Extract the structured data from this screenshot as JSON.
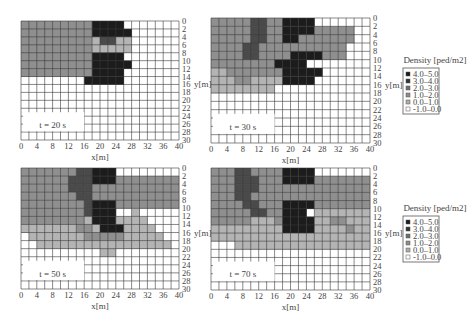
{
  "chart_data": [
    {
      "type": "heatmap",
      "title": "t = 20 s",
      "xlabel": "x[m]",
      "ylabel": "y[m]",
      "xlim": [
        0,
        40
      ],
      "ylim": [
        0,
        30
      ],
      "y_inverted": true,
      "x_ticks": [
        "0",
        "4",
        "8",
        "12",
        "16",
        "20",
        "24",
        "28",
        "32",
        "36",
        "40"
      ],
      "y_ticks": [
        "0",
        "2",
        "4",
        "6",
        "8",
        "10",
        "12",
        "14",
        "16",
        "18",
        "20",
        "22",
        "24",
        "26",
        "28",
        "30"
      ],
      "cell_size_m": 2,
      "grid": true,
      "legend": false,
      "rows": [
        "2222222224444......",
        "22222222244444......",
        "22222222213311......",
        "22222222211111......",
        "2222222224444.......",
        "22222222244444......",
        "2222222224444.......",
        "........44444.......",
        "....................",
        "....................",
        "....................",
        "....................",
        "....................",
        "....................",
        "...................."
      ]
    },
    {
      "type": "heatmap",
      "title": "t = 30 s",
      "xlabel": "x[m]",
      "ylabel": "y[m]",
      "xlim": [
        0,
        40
      ],
      "ylim": [
        0,
        30
      ],
      "y_inverted": true,
      "x_ticks": [
        "0",
        "4",
        "8",
        "12",
        "16",
        "20",
        "24",
        "28",
        "32",
        "36",
        "40"
      ],
      "y_ticks": [
        "0",
        "2",
        "4",
        "6",
        "8",
        "10",
        "12",
        "14",
        "16",
        "18",
        "20",
        "22",
        "24",
        "26",
        "28",
        "30"
      ],
      "cell_size_m": 2,
      "grid": true,
      "legend": true,
      "rows": [
        "2222233224444.......",
        "222223322444422222..",
        "222223322442222222..",
        "22223322222222222...",
        "22223322224444222...",
        "222222224444........",
        "11222222244444......",
        "1112211114444.......",
        "11111111............",
        "....................",
        "....................",
        "....................",
        "....................",
        "....................",
        "...................."
      ]
    },
    {
      "type": "heatmap",
      "title": "t = 50 s",
      "xlabel": "x[m]",
      "ylabel": "y[m]",
      "xlim": [
        0,
        40
      ],
      "ylim": [
        0,
        30
      ],
      "y_inverted": true,
      "x_ticks": [
        "0",
        "4",
        "8",
        "12",
        "16",
        "20",
        "24",
        "28",
        "32",
        "36",
        "40"
      ],
      "y_ticks": [
        "0",
        "2",
        "4",
        "6",
        "8",
        "10",
        "12",
        "14",
        "16",
        "18",
        "20",
        "22",
        "24",
        "26",
        "28",
        "30"
      ],
      "cell_size_m": 2,
      "grid": true,
      "legend": false,
      "rows": [
        "222222233444........",
        "22222233344422222222",
        "22222233322222222222",
        "22222223322222222222",
        "22222222344422222222",
        "222222223444..1.....",
        "2222222214441111....",
        "11111112214441111....",
        ".11111112222211111...",
        "..11111111111111111..",
        "..........11........",
        "....................",
        "....................",
        "....................",
        "...................."
      ]
    },
    {
      "type": "heatmap",
      "title": "t = 70 s",
      "xlabel": "x[m]",
      "ylabel": "y[m]",
      "xlim": [
        0,
        40
      ],
      "ylim": [
        0,
        30
      ],
      "y_inverted": true,
      "x_ticks": [
        "0",
        "4",
        "8",
        "12",
        "16",
        "20",
        "24",
        "28",
        "32",
        "36",
        "40"
      ],
      "y_ticks": [
        "0",
        "2",
        "4",
        "6",
        "8",
        "10",
        "12",
        "14",
        "16",
        "18",
        "20",
        "22",
        "24",
        "26",
        "28",
        "30"
      ],
      "cell_size_m": 2,
      "grid": true,
      "legend": true,
      "rows": [
        "2223322224444.......",
        "22233322244442222222",
        "22233322222222222222",
        "22233222222222222222",
        "22223322244442222222",
        "222223322444.1111111",
        "222221112444411221111",
        "11111111144441111211",
        "11111111111111111111",
        "...11111111111111111.",
        "....................",
        "....................",
        "....................",
        "....................",
        "...................."
      ]
    }
  ],
  "legend": {
    "title": "Density [ped/m2]",
    "items": [
      {
        "label": "4.0–5.0",
        "color": "#1a1a1a"
      },
      {
        "label": "3.0–4.0",
        "color": "#333333"
      },
      {
        "label": "2.0–3.0",
        "color": "#6e6e6e"
      },
      {
        "label": "1.0–2.0",
        "color": "#8c8c8c"
      },
      {
        "label": "0.0–1.0",
        "color": "#adadad"
      },
      {
        "label": "-1.0–0.0",
        "color": "#ffffff"
      }
    ]
  },
  "level_colors": {
    ".": "#ffffff",
    "1": "#b4b4b4",
    "2": "#8f8f8f",
    "3": "#4a4a4a",
    "4": "#1c1c1c"
  }
}
